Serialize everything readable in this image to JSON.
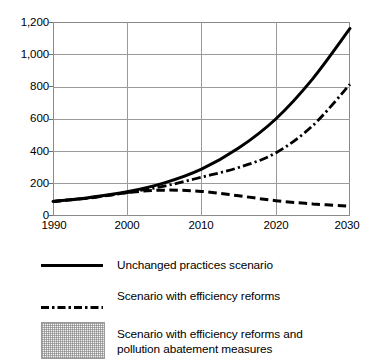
{
  "chart_data": {
    "type": "line",
    "title": "",
    "subtitle": "",
    "xlabel": "",
    "ylabel": "",
    "xlim": [
      1990,
      2030
    ],
    "ylim": [
      0,
      1200
    ],
    "grid": true,
    "legend_position": "below",
    "x_ticks": [
      "1990",
      "2000",
      "2010",
      "2020",
      "2030"
    ],
    "x_tick_values": [
      1990,
      2000,
      2010,
      2020,
      2030
    ],
    "y_ticks": [
      "0",
      "200",
      "400",
      "600",
      "800",
      "1,000",
      "1,200"
    ],
    "y_tick_values": [
      0,
      200,
      400,
      600,
      800,
      1000,
      1200
    ],
    "x": [
      1990,
      1995,
      2000,
      2005,
      2010,
      2015,
      2020,
      2025,
      2030
    ],
    "series": [
      {
        "name": "Unchanged practices scenario",
        "style": "solid",
        "color": "#000000",
        "values": [
          90,
          115,
          150,
          205,
          290,
          420,
          600,
          850,
          1160
        ]
      },
      {
        "name": "Scenario with efficiency reforms",
        "style": "dash-dot",
        "color": "#000000",
        "values": [
          90,
          113,
          145,
          185,
          240,
          300,
          390,
          560,
          815
        ]
      },
      {
        "name": "Scenario with efficiency reforms and pollution abatement measures",
        "style": "dashed",
        "color": "#000000",
        "values": [
          90,
          112,
          145,
          160,
          152,
          125,
          95,
          75,
          60
        ]
      }
    ]
  },
  "axes": {
    "y_tick_labels": [
      "1,200",
      "1,000",
      "800",
      "600",
      "400",
      "200",
      "0"
    ],
    "x_tick_labels": [
      "1990",
      "2000",
      "2010",
      "2020",
      "2030"
    ]
  },
  "legend": {
    "items": [
      {
        "key": "solid-line-key",
        "label": "Unchanged practices scenario",
        "line_1": "Unchanged practices scenario",
        "line_2": ""
      },
      {
        "key": "dash-dot-line-key",
        "label": "Scenario with efficiency reforms",
        "line_1": "Scenario with efficiency reforms",
        "line_2": ""
      },
      {
        "key": "stipple-swatch-key",
        "label": "Scenario with efficiency reforms and pollution abatement measures",
        "line_1": "Scenario with efficiency reforms and",
        "line_2": "pollution abatement measures"
      }
    ]
  },
  "colors": {
    "line": "#000000",
    "grid": "#9a9a9a",
    "frame": "#8a8a8a",
    "swatch_fill": "#f2f2f2",
    "swatch_border": "#9b9b9b",
    "background": "#ffffff"
  }
}
